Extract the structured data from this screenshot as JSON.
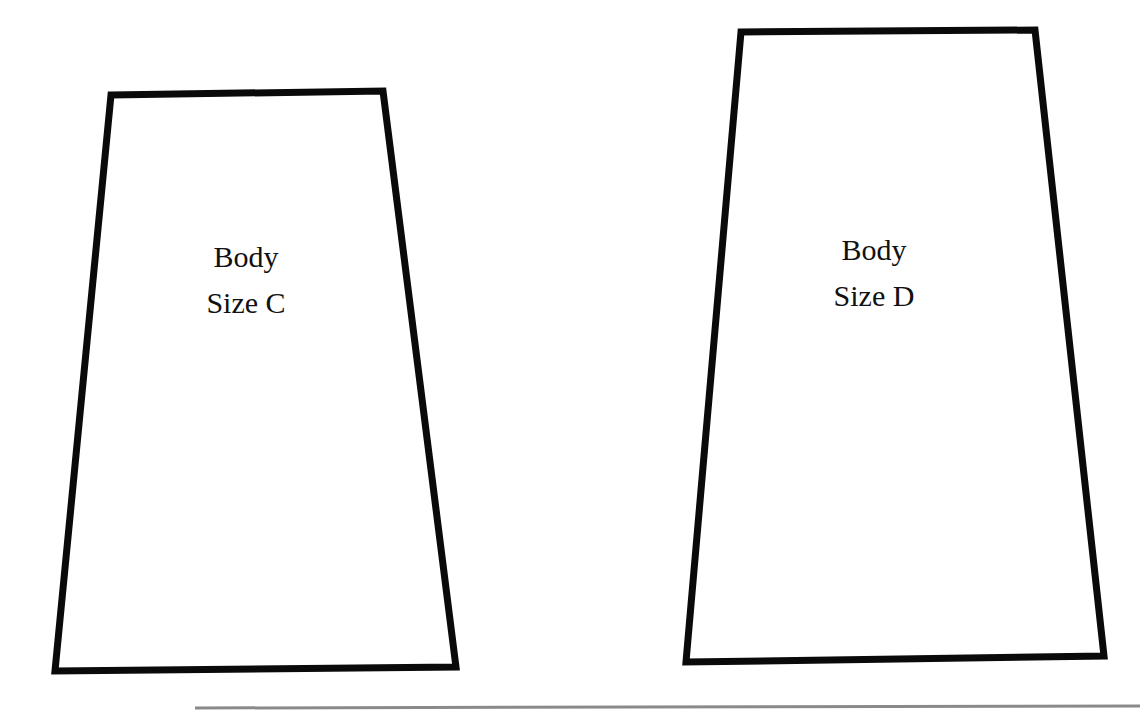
{
  "diagram": {
    "shapes": [
      {
        "id": "body-size-c",
        "label_line1": "Body",
        "label_line2": "Size C",
        "points": "111,95 383,91 456,667 55,671"
      },
      {
        "id": "body-size-d",
        "label_line1": "Body",
        "label_line2": "Size D",
        "points": "741,32 1035,30 1104,656 686,662"
      }
    ],
    "stroke_color": "#0a0a0a",
    "footer_line_color": "#8a8a8a"
  }
}
